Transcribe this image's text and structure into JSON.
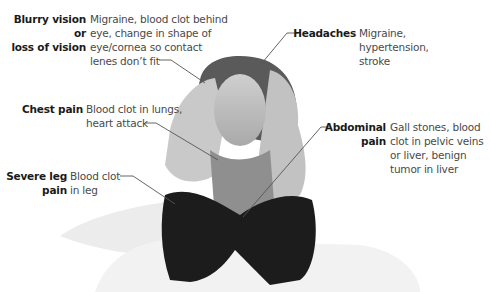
{
  "figure": {
    "annotations": [
      {
        "id": "blurry",
        "label": "Blurry vision or\nloss of vision",
        "description": "Migraine, blood clot behind\neye, change in shape of\neye/cornea so contact\nlenes don’t fit"
      },
      {
        "id": "headaches",
        "label": "Headaches",
        "description": "Migraine,\nhypertension,\nstroke"
      },
      {
        "id": "chest",
        "label": "Chest pain",
        "description": "Blood clot in lungs,\nheart attack"
      },
      {
        "id": "abdominal",
        "label": "Abdominal\npain",
        "description": "Gall stones, blood\nclot in pelvic veins\nor liver, benign\ntumor in liver"
      },
      {
        "id": "leg",
        "label": "Severe leg\npain",
        "description": "Blood clot\nin leg"
      }
    ],
    "colors": {
      "label": "#1a1a1a",
      "description": "#4a4a4a",
      "leader_line": "#555555"
    }
  }
}
